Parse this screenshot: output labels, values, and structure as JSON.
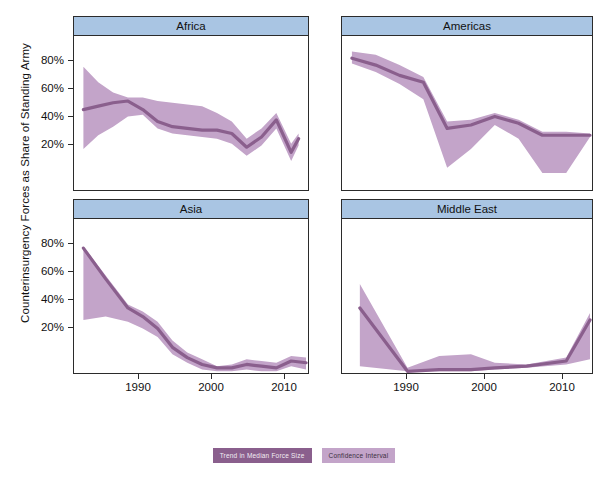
{
  "chart_data": {
    "type": "line",
    "title": "",
    "ylabel": "Counterinsurgency Forces as Share of Standing Army",
    "xlabel": "",
    "xlim": [
      1982,
      2013
    ],
    "ylim": [
      0,
      90
    ],
    "grid": false,
    "yticks": [
      "20%",
      "40%",
      "60%",
      "80%"
    ],
    "ytickvalues": [
      20,
      40,
      60,
      80
    ],
    "xticks": [
      "1990",
      "2000",
      "2010"
    ],
    "xtickvalues": [
      1990,
      2000,
      2010
    ],
    "legend_position": "bottom",
    "series_colors": {
      "trend": "#8a5f8d",
      "band": "#c3a4c9",
      "strip": "#a9c5e3",
      "frame": "#2b2b2b"
    },
    "panels": [
      {
        "name": "Africa",
        "x": [
          1983,
          1985,
          1987,
          1989,
          1991,
          1993,
          1995,
          1997,
          1999,
          2001,
          2003,
          2005,
          2007,
          2009,
          2011,
          2012
        ],
        "median": [
          47,
          49,
          51,
          52,
          47,
          40,
          37,
          36,
          35,
          35,
          33,
          25,
          31,
          41,
          22,
          30
        ],
        "lower": [
          24,
          32,
          37,
          43,
          44,
          36,
          33,
          32,
          31,
          30,
          27,
          20,
          26,
          36,
          17,
          26
        ],
        "upper": [
          72,
          63,
          57,
          54,
          54,
          52,
          51,
          50,
          49,
          45,
          40,
          30,
          36,
          45,
          27,
          33
        ]
      },
      {
        "name": "Americas",
        "x": [
          1983,
          1986,
          1989,
          1992,
          1995,
          1998,
          2001,
          2004,
          2007,
          2010,
          2013
        ],
        "median": [
          77,
          73,
          67,
          63,
          36,
          38,
          43,
          39,
          32,
          32,
          32
        ],
        "lower": [
          74,
          69,
          62,
          53,
          13,
          24,
          38,
          30,
          10,
          10,
          31
        ],
        "upper": [
          81,
          79,
          73,
          66,
          40,
          41,
          45,
          41,
          34,
          34,
          33
        ]
      },
      {
        "name": "Asia",
        "x": [
          1983,
          1986,
          1989,
          1991,
          1993,
          1995,
          1997,
          1999,
          2001,
          2003,
          2005,
          2007,
          2009,
          2011,
          2013
        ],
        "median": [
          73,
          55,
          38,
          33,
          26,
          15,
          9,
          5,
          3,
          3,
          5,
          4,
          3,
          7,
          6
        ],
        "lower": [
          31,
          33,
          30,
          26,
          21,
          11,
          6,
          2,
          1,
          1,
          2,
          1,
          1,
          4,
          2
        ],
        "upper": [
          74,
          57,
          40,
          36,
          30,
          19,
          12,
          8,
          4,
          5,
          8,
          7,
          6,
          10,
          9
        ]
      },
      {
        "name": "Middle East",
        "x": [
          1984,
          1990,
          1994,
          1998,
          2001,
          2005,
          2010,
          2013
        ],
        "median": [
          38,
          1,
          2,
          2,
          3,
          4,
          7,
          31
        ],
        "lower": [
          4,
          1,
          1,
          1,
          2,
          3,
          5,
          8
        ],
        "upper": [
          52,
          3,
          10,
          11,
          6,
          5,
          9,
          35
        ]
      }
    ],
    "legend": [
      {
        "label": "Trend in Median Force Size",
        "color": "#8a5f8d"
      },
      {
        "label": "Confidence Interval",
        "color": "#c3a4c9"
      }
    ]
  }
}
